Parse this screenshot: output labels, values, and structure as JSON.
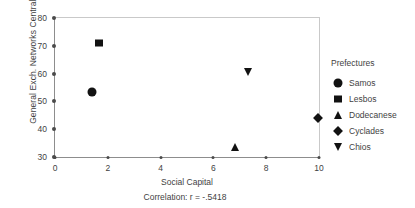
{
  "chart_data": {
    "type": "scatter",
    "title": "",
    "xlabel": "Social Capital",
    "ylabel": "General Exch. Networks Centrality",
    "xlim": [
      0,
      10
    ],
    "ylim": [
      30,
      80
    ],
    "xticks": [
      "0",
      "2",
      "4",
      "6",
      "8",
      "10"
    ],
    "xtick_values": [
      0,
      2,
      4,
      6,
      8,
      10
    ],
    "yticks": [
      "30",
      "40",
      "50",
      "60",
      "70",
      "80"
    ],
    "ytick_values": [
      30,
      40,
      50,
      60,
      70,
      80
    ],
    "grid": false,
    "legend_position": "right",
    "legend_title": "Prefectures",
    "annotation": "Correlation: r = -.5418",
    "series": [
      {
        "name": "Samos",
        "marker": "circle",
        "x": 1.4,
        "y": 53.5
      },
      {
        "name": "Lesbos",
        "marker": "square",
        "x": 1.65,
        "y": 71.0
      },
      {
        "name": "Dodecanese",
        "marker": "triangle-up",
        "x": 6.8,
        "y": 33.5
      },
      {
        "name": "Cyclades",
        "marker": "diamond",
        "x": 9.95,
        "y": 44.0
      },
      {
        "name": "Chios",
        "marker": "triangle-down",
        "x": 7.3,
        "y": 60.5
      }
    ],
    "marker_color": "#121212"
  },
  "legend": {
    "title": "Prefectures",
    "items": [
      {
        "label": "Samos",
        "shape": "circle"
      },
      {
        "label": "Lesbos",
        "shape": "square"
      },
      {
        "label": "Dodecanese",
        "shape": "triangle-up"
      },
      {
        "label": "Cyclades",
        "shape": "diamond"
      },
      {
        "label": "Chios",
        "shape": "triangle-down"
      }
    ]
  },
  "caption": "Correlation: r = -.5418",
  "axes": {
    "x_title": "Social Capital",
    "y_title": "General Exch. Networks Centrality"
  }
}
